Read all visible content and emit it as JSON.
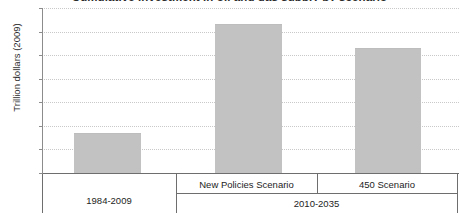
{
  "chart_data": {
    "type": "bar",
    "title": "Cumulative investment in oil and gas supply by scenario",
    "ylabel": "Trillion dollars (2009)",
    "xlabel": "",
    "categories": [
      "1984-2009",
      "New Policies Scenario",
      "450 Scenario"
    ],
    "values": [
      8.2,
      31.5,
      26.3
    ],
    "ylim": [
      0,
      35
    ],
    "yticks": [
      0,
      5,
      10,
      15,
      20,
      25,
      30,
      35
    ],
    "ytick_labels": [
      "0",
      "5",
      "10",
      "15",
      "20",
      "25",
      "30",
      "35"
    ],
    "grid": true,
    "legend": "none",
    "series": [
      {
        "name": "Cumulative investment",
        "values": [
          8.2,
          31.5,
          26.3
        ],
        "color": "#c2c2c2"
      }
    ],
    "group_labels": [
      {
        "label": "1984-2009",
        "members": [
          "1984-2009"
        ]
      },
      {
        "label": "2010-2035",
        "members": [
          "New Policies Scenario",
          "450 Scenario"
        ]
      }
    ]
  },
  "axis": {
    "y_title": "Trillion dollars (2009)",
    "ticks": [
      "35",
      "30",
      "25",
      "20",
      "15",
      "10",
      "5",
      "0"
    ]
  },
  "categories": {
    "first": "1984-2009",
    "second": "New Policies Scenario",
    "third": "450 Scenario",
    "group_second": "2010-2035"
  },
  "colors": {
    "bar_fill": "#c2c2c2",
    "axis": "#6e6e6e",
    "grid": "#c9c9c9",
    "text": "#1d1d1d"
  }
}
